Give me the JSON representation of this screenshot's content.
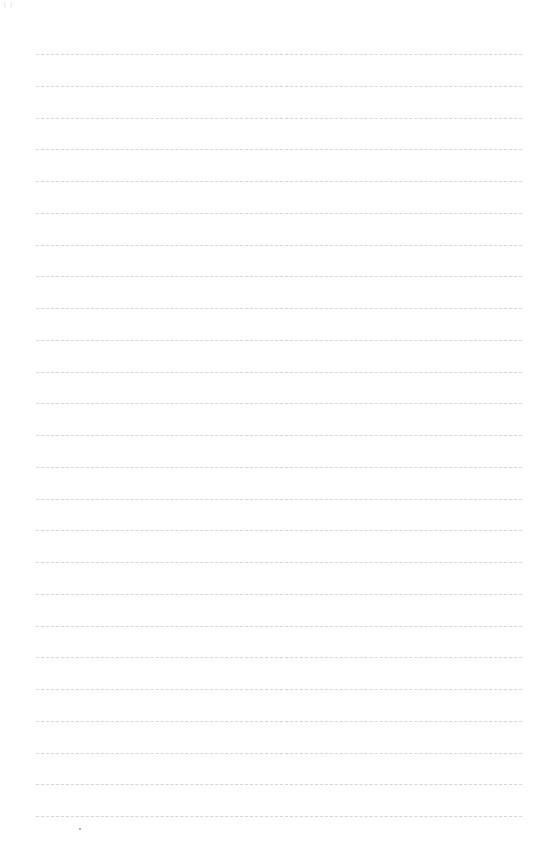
{
  "page": {
    "type": "lined-paper",
    "background_color": "#ffffff",
    "line_color": "#cfcfcf",
    "line_style": "dashed",
    "line_count": 25,
    "first_line_y": 54,
    "line_spacing": 31.75,
    "line_left_x": 36,
    "line_right_x": 522
  },
  "marks": {
    "bottom_dot": {
      "x": 80,
      "y": 829
    }
  }
}
